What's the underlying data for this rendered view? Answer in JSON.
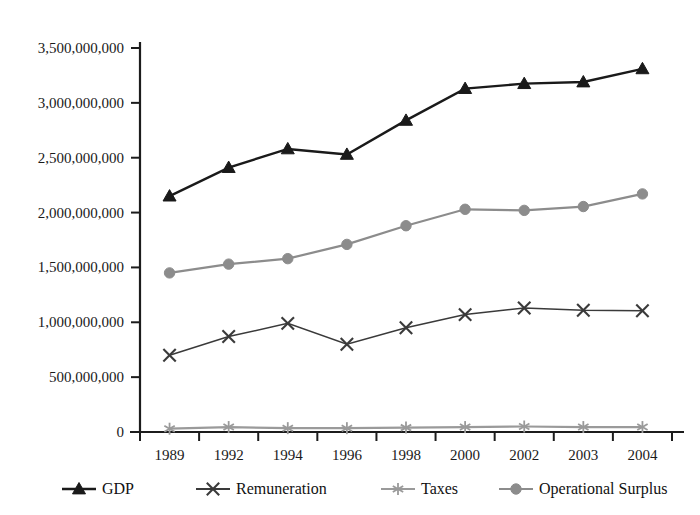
{
  "chart_data": {
    "type": "line",
    "title": "",
    "subtitle": "",
    "xlabel": "",
    "ylabel": "",
    "categories": [
      "1989",
      "1992",
      "1994",
      "1996",
      "1998",
      "2000",
      "2002",
      "2003",
      "2004"
    ],
    "ylim": [
      0,
      3500000000
    ],
    "ytick_values": [
      0,
      500000000,
      1000000000,
      1500000000,
      2000000000,
      2500000000,
      3000000000,
      3500000000
    ],
    "ytick_labels": [
      "0",
      "500,000,000",
      "1,000,000,000",
      "1,500,000,000",
      "2,000,000,000",
      "2,500,000,000",
      "3,000,000,000",
      "3,500,000,000"
    ],
    "grid": false,
    "legend_position": "bottom",
    "series": [
      {
        "name": "GDP",
        "marker": "triangle",
        "color": "#1a1a1a",
        "values": [
          2150000000,
          2410000000,
          2580000000,
          2530000000,
          2840000000,
          3130000000,
          3175000000,
          3190000000,
          3310000000
        ]
      },
      {
        "name": "Remuneration",
        "marker": "x",
        "color": "#3a3a3a",
        "values": [
          700000000,
          870000000,
          990000000,
          800000000,
          950000000,
          1070000000,
          1130000000,
          1110000000,
          1105000000
        ]
      },
      {
        "name": "Taxes",
        "marker": "asterisk",
        "color": "#9a9a9a",
        "values": [
          30000000,
          45000000,
          35000000,
          35000000,
          40000000,
          45000000,
          50000000,
          45000000,
          45000000
        ]
      },
      {
        "name": "Operational Surplus",
        "marker": "circle",
        "color": "#8c8c8c",
        "values": [
          1450000000,
          1530000000,
          1580000000,
          1710000000,
          1880000000,
          2030000000,
          2020000000,
          2055000000,
          2170000000
        ]
      }
    ]
  },
  "legend": {
    "items": [
      {
        "label": "GDP"
      },
      {
        "label": "Remuneration"
      },
      {
        "label": "Taxes"
      },
      {
        "label": "Operational Surplus"
      }
    ]
  }
}
